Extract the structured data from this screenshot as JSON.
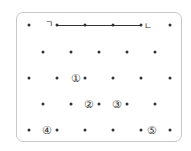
{
  "diagram": {
    "type": "dot-grid",
    "colors": {
      "dot": "#333333",
      "frame": "#c8c8c8"
    },
    "segment_labels": {
      "start": "ㄱ",
      "end": "ㄴ"
    },
    "rows": [
      {
        "y": 25,
        "dots_x": [
          29,
          57,
          85,
          113,
          141,
          170
        ]
      },
      {
        "y": 52,
        "dots_x": [
          43,
          71,
          99,
          127,
          155
        ]
      },
      {
        "y": 78,
        "dots_x": [
          29,
          57,
          85,
          113,
          141,
          170
        ]
      },
      {
        "y": 104,
        "dots_x": [
          43,
          71,
          99,
          127,
          155
        ]
      },
      {
        "y": 130,
        "dots_x": [
          29,
          57,
          85,
          113,
          141,
          170
        ]
      }
    ],
    "segment": {
      "x1": 57,
      "x2": 141,
      "y": 25
    },
    "choices": [
      {
        "label": "①",
        "x": 76,
        "y": 78
      },
      {
        "label": "②",
        "x": 89,
        "y": 104
      },
      {
        "label": "③",
        "x": 117,
        "y": 104
      },
      {
        "label": "④",
        "x": 47,
        "y": 130
      },
      {
        "label": "⑤",
        "x": 152,
        "y": 130
      }
    ]
  }
}
